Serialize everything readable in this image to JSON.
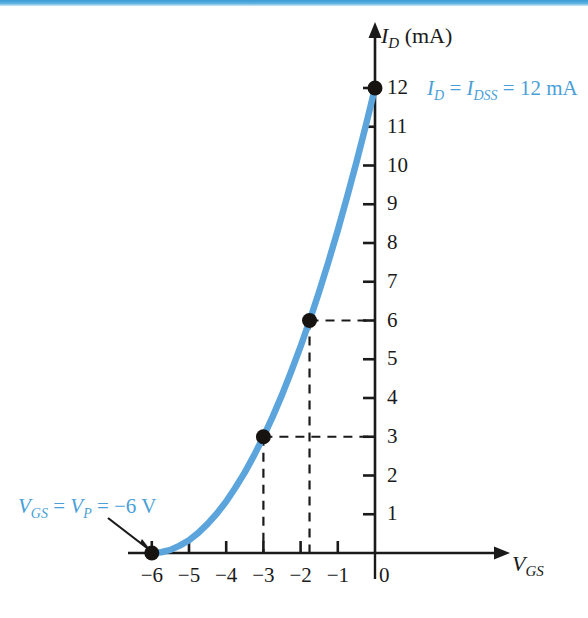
{
  "figure": {
    "background_color": "#ffffff",
    "top_bar_color": "#3d9bd4",
    "curve_color": "#5ba4dc",
    "axis_color": "#1a1a1a"
  },
  "axes": {
    "y_title_main": "I",
    "y_title_sub": "D",
    "y_title_unit": "(mA)",
    "x_title_main": "V",
    "x_title_sub": "GS"
  },
  "annotations": {
    "idss": {
      "v1": "I",
      "s1": "D",
      "eq1": " = ",
      "v2": "I",
      "s2": "DSS",
      "eq2": " = 12 mA"
    },
    "vp": {
      "v1": "V",
      "s1": "GS",
      "eq1": " = ",
      "v2": "V",
      "s2": "P",
      "eq2": " = −6 V"
    }
  },
  "chart_data": {
    "type": "line",
    "title": "",
    "xlabel": "VGS",
    "ylabel": "ID (mA)",
    "xlim": [
      -6.4,
      0.6
    ],
    "ylim": [
      0,
      12.8
    ],
    "grid": false,
    "legend": "none",
    "x_ticks": [
      -6,
      -5,
      -4,
      -3,
      -2,
      -1,
      0
    ],
    "x_tick_labels": [
      "−6",
      "−5",
      "−4",
      "−3",
      "−2",
      "−1",
      "0"
    ],
    "y_ticks": [
      1,
      2,
      3,
      4,
      5,
      6,
      7,
      8,
      9,
      10,
      11,
      12
    ],
    "y_tick_labels": [
      "1",
      "2",
      "3",
      "4",
      "5",
      "6",
      "7",
      "8",
      "9",
      "10",
      "11",
      "12"
    ],
    "series": [
      {
        "name": "Shockley transfer curve",
        "equation": "ID = IDSS (1 - VGS/VP)^2",
        "idss": 12,
        "vp": -6,
        "x": [
          -6.0,
          -5.75,
          -5.5,
          -5.25,
          -5.0,
          -4.75,
          -4.5,
          -4.25,
          -4.0,
          -3.75,
          -3.5,
          -3.25,
          -3.0,
          -2.75,
          -2.5,
          -2.25,
          -2.0,
          -1.75,
          -1.5,
          -1.25,
          -1.0,
          -0.75,
          -0.5,
          -0.25,
          0.0
        ],
        "y": [
          0.0,
          0.02,
          0.08,
          0.19,
          0.33,
          0.52,
          0.75,
          1.02,
          1.33,
          1.69,
          2.08,
          2.52,
          3.0,
          3.52,
          4.08,
          4.69,
          5.33,
          6.02,
          6.75,
          7.52,
          8.33,
          9.19,
          10.08,
          11.02,
          12.0
        ]
      }
    ],
    "points": [
      {
        "label": "pinch-off",
        "x": -6,
        "y": 0,
        "dashed_guides": false
      },
      {
        "label": "half-pinchoff",
        "x": -3,
        "y": 3,
        "dashed_guides": true
      },
      {
        "label": "quarter-pinchoff",
        "x": -1.76,
        "y": 6,
        "dashed_guides": true
      },
      {
        "label": "saturation",
        "x": 0,
        "y": 12,
        "dashed_guides": false
      }
    ]
  }
}
